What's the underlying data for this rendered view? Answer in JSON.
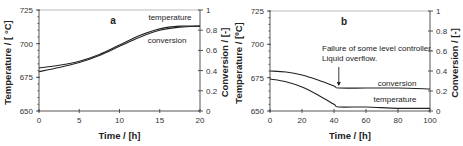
{
  "chart_data": [
    {
      "type": "line",
      "panel_label": "a",
      "xlabel": "Time / [h]",
      "ylabel": "Temperature / [ °C]",
      "y2label": "Conversion / [-]",
      "xlim": [
        0,
        20
      ],
      "ylim": [
        650,
        725
      ],
      "y2lim": [
        0,
        1
      ],
      "xticks": [
        "0",
        "5",
        "10",
        "15",
        "20"
      ],
      "yticks": [
        "650",
        "675",
        "700",
        "725"
      ],
      "y2ticks": [
        "0",
        "0.2",
        "0.4",
        "0.6",
        "0.8",
        "1"
      ],
      "series": [
        {
          "name": "temperature",
          "axis": "left",
          "x": [
            0,
            2.5,
            5,
            7.5,
            10,
            12.5,
            15,
            17.5,
            20
          ],
          "values": [
            682,
            684,
            687,
            692,
            699,
            706,
            711,
            713,
            713
          ]
        },
        {
          "name": "conversion",
          "axis": "right",
          "x": [
            0,
            2.5,
            5,
            7.5,
            10,
            12.5,
            15,
            17.5,
            20
          ],
          "values": [
            0.39,
            0.43,
            0.48,
            0.55,
            0.64,
            0.73,
            0.8,
            0.83,
            0.84
          ]
        }
      ],
      "legend_labels": [
        "temperature",
        "conversion"
      ]
    },
    {
      "type": "line",
      "panel_label": "b",
      "xlabel": "Time / [h]",
      "ylabel": "Temperature / [ºC]",
      "y2label": "Conversion / [-]",
      "xlim": [
        0,
        100
      ],
      "ylim": [
        650,
        725
      ],
      "y2lim": [
        0,
        1
      ],
      "xticks": [
        "0",
        "20",
        "40",
        "60",
        "80",
        "100"
      ],
      "yticks": [
        "650",
        "675",
        "700",
        "725"
      ],
      "y2ticks": [
        "0",
        "0.2",
        "0.4",
        "0.6",
        "0.8",
        "1"
      ],
      "series": [
        {
          "name": "conversion",
          "axis": "right",
          "x": [
            0,
            10,
            20,
            30,
            40,
            43,
            60,
            80,
            100
          ],
          "values": [
            0.4,
            0.39,
            0.36,
            0.31,
            0.25,
            0.23,
            0.23,
            0.23,
            0.22
          ]
        },
        {
          "name": "temperature",
          "axis": "left",
          "x": [
            0,
            10,
            20,
            30,
            40,
            43,
            60,
            80,
            100
          ],
          "values": [
            674,
            672,
            668,
            662,
            655,
            653,
            653,
            652,
            652
          ]
        }
      ],
      "annotations": [
        "Failure of some level controller.",
        "Liquid overflow."
      ],
      "legend_labels": [
        "conversion",
        "temperature"
      ]
    }
  ]
}
